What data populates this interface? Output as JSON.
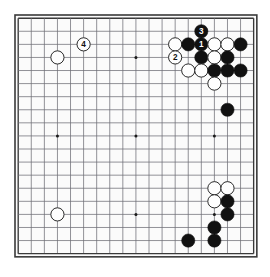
{
  "diagram": {
    "type": "go-board-position",
    "board_size": 19,
    "geometry": {
      "origin_x": 18.2,
      "origin_y": 18.2,
      "spacing": 13.08,
      "stone_radius": 6.6,
      "border_color": "#3a3a3a",
      "grid_color": "#6e6e75",
      "background_color": "#fbfbfb",
      "black_color": "#111111",
      "white_color": "#fefefe",
      "white_outline_color": "#2a2a2a",
      "star_color": "#1a1a1a"
    },
    "star_points": [
      {
        "col": 4,
        "row": 4
      },
      {
        "col": 10,
        "row": 4
      },
      {
        "col": 16,
        "row": 4
      },
      {
        "col": 4,
        "row": 10
      },
      {
        "col": 10,
        "row": 10
      },
      {
        "col": 16,
        "row": 10
      },
      {
        "col": 4,
        "row": 16
      },
      {
        "col": 10,
        "row": 16
      },
      {
        "col": 16,
        "row": 16
      }
    ],
    "stones": [
      {
        "col": 4,
        "row": 4,
        "color": "white",
        "label": ""
      },
      {
        "col": 6,
        "row": 3,
        "color": "white",
        "label": "4"
      },
      {
        "col": 13,
        "row": 3,
        "color": "white",
        "label": ""
      },
      {
        "col": 14,
        "row": 3,
        "color": "black",
        "label": ""
      },
      {
        "col": 15,
        "row": 2,
        "color": "black",
        "label": "3"
      },
      {
        "col": 15,
        "row": 3,
        "color": "black",
        "label": "1"
      },
      {
        "col": 16,
        "row": 3,
        "color": "white",
        "label": ""
      },
      {
        "col": 17,
        "row": 3,
        "color": "white",
        "label": ""
      },
      {
        "col": 18,
        "row": 3,
        "color": "black",
        "label": ""
      },
      {
        "col": 13,
        "row": 4,
        "color": "white",
        "label": "2"
      },
      {
        "col": 15,
        "row": 4,
        "color": "black",
        "label": ""
      },
      {
        "col": 16,
        "row": 4,
        "color": "white",
        "label": ""
      },
      {
        "col": 17,
        "row": 4,
        "color": "black",
        "label": ""
      },
      {
        "col": 14,
        "row": 5,
        "color": "white",
        "label": ""
      },
      {
        "col": 15,
        "row": 5,
        "color": "white",
        "label": ""
      },
      {
        "col": 16,
        "row": 5,
        "color": "black",
        "label": ""
      },
      {
        "col": 17,
        "row": 5,
        "color": "black",
        "label": ""
      },
      {
        "col": 18,
        "row": 5,
        "color": "black",
        "label": ""
      },
      {
        "col": 16,
        "row": 6,
        "color": "white",
        "label": ""
      },
      {
        "col": 17,
        "row": 8,
        "color": "black",
        "label": ""
      },
      {
        "col": 4,
        "row": 16,
        "color": "white",
        "label": ""
      },
      {
        "col": 16,
        "row": 14,
        "color": "white",
        "label": ""
      },
      {
        "col": 17,
        "row": 14,
        "color": "white",
        "label": ""
      },
      {
        "col": 16,
        "row": 15,
        "color": "white",
        "label": ""
      },
      {
        "col": 17,
        "row": 15,
        "color": "black",
        "label": ""
      },
      {
        "col": 17,
        "row": 16,
        "color": "black",
        "label": ""
      },
      {
        "col": 16,
        "row": 17,
        "color": "black",
        "label": ""
      },
      {
        "col": 14,
        "row": 18,
        "color": "black",
        "label": ""
      },
      {
        "col": 16,
        "row": 18,
        "color": "black",
        "label": ""
      }
    ],
    "move_labels": [
      "1",
      "2",
      "3",
      "4"
    ]
  }
}
